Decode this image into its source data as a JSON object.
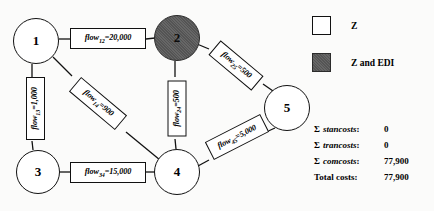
{
  "diagram": {
    "type": "network-flow-diagram",
    "nodes": [
      {
        "id": "1",
        "label": "1",
        "fill": "white",
        "cx": 36,
        "cy": 41,
        "r": 23
      },
      {
        "id": "2",
        "label": "2",
        "fill": "shaded",
        "cx": 177,
        "cy": 38,
        "r": 23
      },
      {
        "id": "3",
        "label": "3",
        "fill": "white",
        "cx": 38,
        "cy": 172,
        "r": 22
      },
      {
        "id": "4",
        "label": "4",
        "fill": "white",
        "cx": 177,
        "cy": 172,
        "r": 23
      },
      {
        "id": "5",
        "label": "5",
        "fill": "white",
        "cx": 287,
        "cy": 108,
        "r": 23
      }
    ],
    "edges": [
      {
        "from": "1",
        "to": "2",
        "flow_name": "flow",
        "subscript": "12",
        "value": "20,000",
        "label": "flow12=20,000"
      },
      {
        "from": "1",
        "to": "3",
        "flow_name": "flow",
        "subscript": "13",
        "value": "1,000",
        "label": "flow13=1,000"
      },
      {
        "from": "1",
        "to": "4",
        "flow_name": "flow",
        "subscript": "14",
        "value": "900",
        "label": "flow14=900"
      },
      {
        "from": "2",
        "to": "4",
        "flow_name": "flow",
        "subscript": "24",
        "value": "500",
        "label": "flow24=500"
      },
      {
        "from": "2",
        "to": "5",
        "flow_name": "flow",
        "subscript": "25",
        "value": "500",
        "label": "flow25=500"
      },
      {
        "from": "3",
        "to": "4",
        "flow_name": "flow",
        "subscript": "34",
        "value": "15,000",
        "label": "flow34=15,000"
      },
      {
        "from": "4",
        "to": "5",
        "flow_name": "flow",
        "subscript": "45",
        "value": "5,000",
        "label": "flow45=5,000"
      }
    ]
  },
  "legend": {
    "items": [
      {
        "swatch": "white",
        "label": "Z"
      },
      {
        "swatch": "shaded",
        "label": "Z and EDI"
      }
    ]
  },
  "costs": {
    "rows": [
      {
        "sigma": "Σ",
        "term": "stancosts",
        "colon": ":",
        "value": "0"
      },
      {
        "sigma": "Σ",
        "term": "trancosts",
        "colon": ":",
        "value": "0"
      },
      {
        "sigma": "Σ",
        "term": "comcosts",
        "colon": ":",
        "value": "77,900"
      }
    ],
    "total_label": "Total costs:",
    "total_value": "77,900"
  },
  "colors": {
    "background": "#fbfbfa",
    "stroke": "#111111",
    "node_white": "#ffffff",
    "node_shaded": "#5d5d5d",
    "text": "#000000"
  }
}
